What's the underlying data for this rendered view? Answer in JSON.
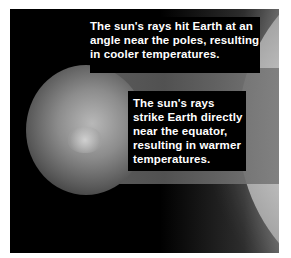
{
  "diagram": {
    "labels": {
      "poles": "The sun's rays hit Earth at an angle near the poles, resulting in cooler temperatures.",
      "equator": "The sun's rays strike Earth directly near the equator, resulting in warmer temperatures."
    },
    "elements": [
      "earth",
      "sun",
      "sun-rays-band"
    ],
    "colors": {
      "background": "#000000",
      "text": "#ffffff",
      "rays": "#6a6a6a"
    }
  }
}
